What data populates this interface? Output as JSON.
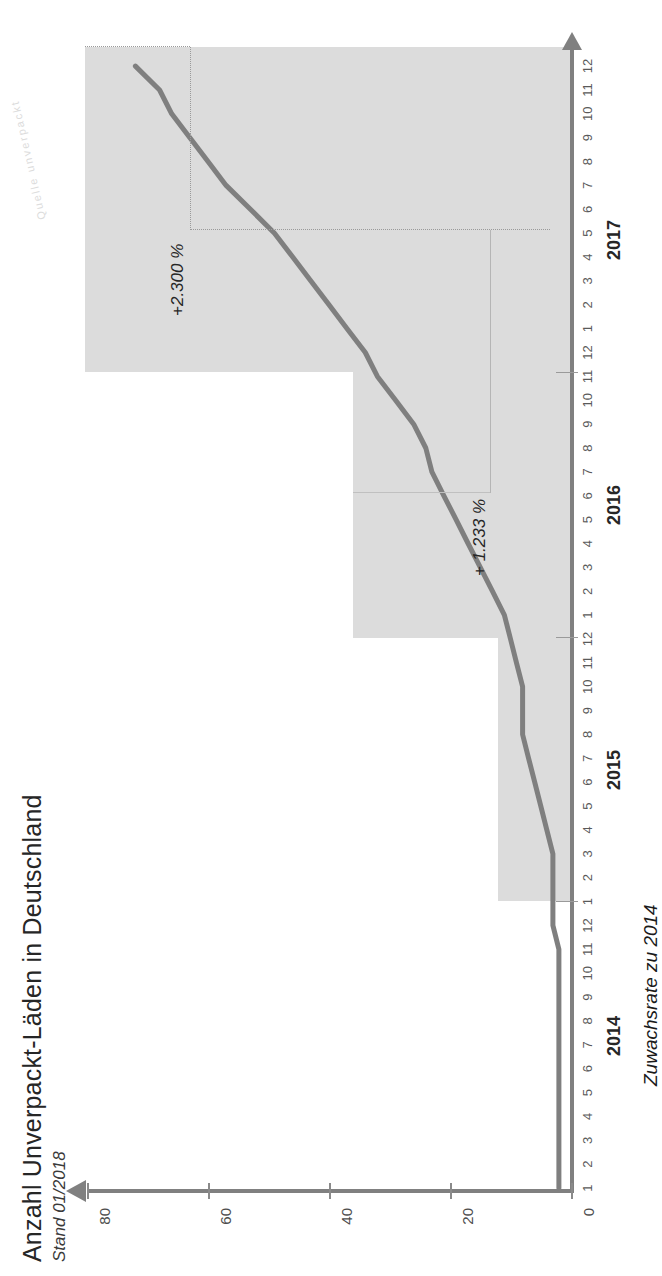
{
  "title": "Anzahl Unverpackt-Läden in Deutschland",
  "subtitle": "Stand 01/2018",
  "credit_faint": "Quelle unverpackt",
  "group_label": "Zuwachsrate zu 2014",
  "annotations": [
    {
      "id": "growth-2015",
      "label": "+367 %"
    },
    {
      "id": "growth-2016",
      "label": "+ 1.233 %"
    },
    {
      "id": "growth-2017",
      "label": "+2.300 %"
    }
  ],
  "axis": {
    "y_ticks": [
      "0",
      "20",
      "40",
      "60",
      "80"
    ],
    "y_label": "",
    "x_months": [
      "1",
      "2",
      "3",
      "4",
      "5",
      "6",
      "7",
      "8",
      "9",
      "10",
      "11",
      "12"
    ],
    "years": [
      "2014",
      "2015",
      "2016",
      "2017"
    ]
  },
  "colors": {
    "line": "#7f7f7f",
    "band": "#dcdcdc",
    "axis": "#808080",
    "text": "#262626"
  },
  "chart_data": {
    "type": "line",
    "title": "Anzahl Unverpackt-Läden in Deutschland",
    "subtitle": "Stand 01/2018",
    "xlabel": "",
    "ylabel": "Anzahl Läden",
    "ylim": [
      0,
      85
    ],
    "yticks": [
      0,
      20,
      40,
      60,
      80
    ],
    "grid": false,
    "legend": "none",
    "x": [
      "2014-1",
      "2014-2",
      "2014-3",
      "2014-4",
      "2014-5",
      "2014-6",
      "2014-7",
      "2014-8",
      "2014-9",
      "2014-10",
      "2014-11",
      "2014-12",
      "2015-1",
      "2015-2",
      "2015-3",
      "2015-4",
      "2015-5",
      "2015-6",
      "2015-7",
      "2015-8",
      "2015-9",
      "2015-10",
      "2015-11",
      "2015-12",
      "2016-1",
      "2016-2",
      "2016-3",
      "2016-4",
      "2016-5",
      "2016-6",
      "2016-7",
      "2016-8",
      "2016-9",
      "2016-10",
      "2016-11",
      "2016-12",
      "2017-1",
      "2017-2",
      "2017-3",
      "2017-4",
      "2017-5",
      "2017-6",
      "2017-7",
      "2017-8",
      "2017-9",
      "2017-10",
      "2017-11",
      "2017-12"
    ],
    "values": [
      2,
      2,
      2,
      2,
      2,
      2,
      2,
      2,
      2,
      2,
      2,
      3,
      3,
      3,
      3,
      4,
      5,
      6,
      7,
      8,
      8,
      8,
      9,
      10,
      11,
      13,
      15,
      17,
      19,
      21,
      23,
      24,
      26,
      29,
      32,
      34,
      37,
      40,
      43,
      46,
      49,
      53,
      57,
      60,
      63,
      66,
      68,
      72
    ],
    "annotations": [
      {
        "text": "+367 %",
        "at": "2015-12",
        "note": "Zuwachsrate zu 2014"
      },
      {
        "text": "+ 1.233 %",
        "at": "2016-12",
        "note": "Zuwachsrate zu 2014"
      },
      {
        "text": "+2.300 %",
        "at": "2017-12",
        "note": "Zuwachsrate zu 2014"
      }
    ],
    "bands": [
      {
        "year": "2015",
        "top": 12
      },
      {
        "year": "2016",
        "top": 36
      },
      {
        "year": "2017",
        "top": 74
      }
    ]
  }
}
